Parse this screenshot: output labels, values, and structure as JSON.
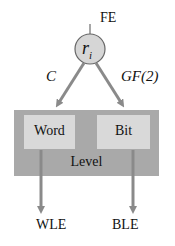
{
  "diagram": {
    "top_label": "FE",
    "node": {
      "symbol": "r",
      "subscript": "i"
    },
    "left_edge_label": "C",
    "right_edge_label": "GF(2)",
    "container_label": "Level",
    "left_box_label": "Word",
    "right_box_label": "Bit",
    "left_output": "WLE",
    "right_output": "BLE"
  },
  "colors": {
    "arrow": "#8a8a8a",
    "node_fill": "#d6d6d6",
    "container_fill": "#a9a9a9",
    "inner_box_fill": "#d9d9d9",
    "text": "#111111"
  }
}
